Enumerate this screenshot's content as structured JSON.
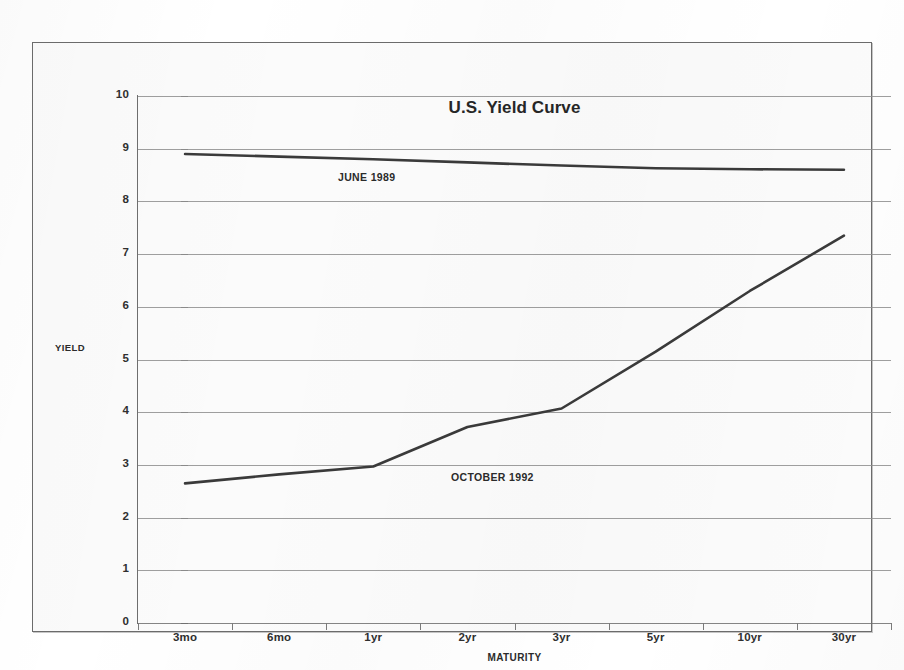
{
  "chart_data": {
    "type": "line",
    "title": "U.S. Yield Curve",
    "xlabel": "MATURITY",
    "ylabel": "YIELD",
    "categories": [
      "3mo",
      "6mo",
      "1yr",
      "2yr",
      "3yr",
      "5yr",
      "10yr",
      "30yr"
    ],
    "ylim": [
      0,
      10
    ],
    "ytick_labels": [
      "0",
      "1",
      "2",
      "3",
      "4",
      "5",
      "6",
      "7",
      "8",
      "9",
      "10"
    ],
    "ytick_values": [
      0,
      1,
      2,
      3,
      4,
      5,
      6,
      7,
      8,
      9,
      10
    ],
    "grid": true,
    "legend_position": "inline-annotation",
    "series": [
      {
        "name": "JUNE 1989",
        "values": [
          8.9,
          8.85,
          8.8,
          8.74,
          8.68,
          8.63,
          8.61,
          8.6
        ],
        "color": "#3a3a3a"
      },
      {
        "name": "OCTOBER 1992",
        "values": [
          2.65,
          2.82,
          2.97,
          3.72,
          4.07,
          5.15,
          6.3,
          7.35
        ],
        "color": "#3a3a3a"
      }
    ],
    "annotations": [
      {
        "text": "JUNE 1989",
        "near_series": "JUNE 1989"
      },
      {
        "text": "OCTOBER 1992",
        "near_series": "OCTOBER 1992"
      }
    ]
  }
}
